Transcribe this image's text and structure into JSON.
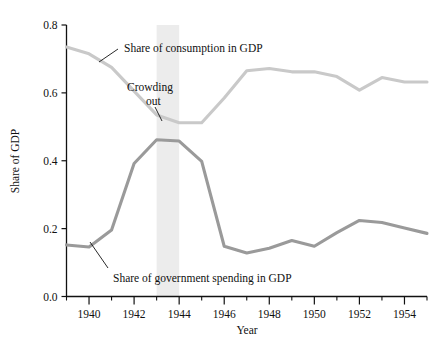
{
  "chart_data": {
    "type": "line",
    "title": "",
    "xlabel": "Year",
    "ylabel": "Share of GDP",
    "xlim": [
      1939,
      1955
    ],
    "ylim": [
      0.0,
      0.8
    ],
    "grid": false,
    "legend_position": "inline-annotations",
    "x": [
      1939,
      1940,
      1941,
      1942,
      1943,
      1944,
      1945,
      1946,
      1947,
      1948,
      1949,
      1950,
      1951,
      1952,
      1953,
      1954,
      1955
    ],
    "y_tick_labels": [
      "0.0",
      "0.2",
      "0.4",
      "0.6",
      "0.8"
    ],
    "y_tick_values": [
      0.0,
      0.2,
      0.4,
      0.6,
      0.8
    ],
    "x_tick_labels": [
      "1940",
      "1942",
      "1944",
      "1946",
      "1948",
      "1950",
      "1952",
      "1954"
    ],
    "x_tick_values": [
      1940,
      1942,
      1944,
      1946,
      1948,
      1950,
      1952,
      1954
    ],
    "x_minor_ticks": [
      1939,
      1941,
      1943,
      1945,
      1947,
      1949,
      1951,
      1953,
      1955
    ],
    "series": [
      {
        "name": "Share of consumption in GDP",
        "color": "#c9c9c9",
        "values": [
          0.735,
          0.715,
          0.675,
          0.605,
          0.535,
          0.512,
          0.512,
          0.585,
          0.665,
          0.672,
          0.662,
          0.662,
          0.648,
          0.608,
          0.645,
          0.632,
          0.632
        ]
      },
      {
        "name": "Share of government spending in GDP",
        "color": "#9a9a9a",
        "values": [
          0.152,
          0.146,
          0.196,
          0.392,
          0.462,
          0.458,
          0.398,
          0.148,
          0.128,
          0.142,
          0.165,
          0.148,
          0.188,
          0.224,
          0.218,
          0.202,
          0.186
        ]
      }
    ],
    "annotations": [
      {
        "name": "consumption-label",
        "text": "Share of consumption in GDP",
        "leader": true
      },
      {
        "name": "crowding-out-label",
        "text_line1": "Crowding",
        "text_line2": "out",
        "leader": true
      },
      {
        "name": "government-spending-label",
        "text": "Share of government spending in GDP",
        "leader": true
      }
    ],
    "shaded_band": {
      "name": "crowding-out-band",
      "from": 1943,
      "to": 1944,
      "color": "#ececec"
    }
  },
  "axes": {
    "x_axis_title": "Year",
    "y_axis_title": "Share of GDP",
    "axis_color": "#111111"
  }
}
